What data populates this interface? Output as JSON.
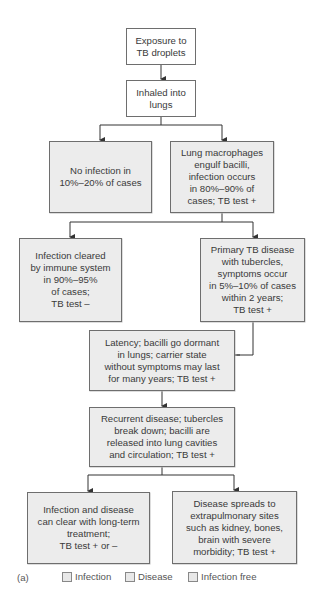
{
  "diagram": {
    "nodes": [
      {
        "id": "exposure",
        "text": "Exposure to\nTB droplets"
      },
      {
        "id": "inhaled",
        "text": "Inhaled into\nlungs"
      },
      {
        "id": "no_infection",
        "text": "No infection in\n10%–20% of cases"
      },
      {
        "id": "macrophages",
        "text": "Lung macrophages\nengulf bacilli,\ninfection occurs\nin 80%–90% of\ncases; TB test +"
      },
      {
        "id": "cleared",
        "text": "Infection cleared\nby immune system\nin 90%–95%\nof cases;\nTB test –"
      },
      {
        "id": "primary",
        "text": "Primary TB disease\nwith tubercles,\nsymptoms occur\nin 5%–10% of cases\nwithin 2 years;\nTB test +"
      },
      {
        "id": "latency",
        "text": "Latency; bacilli go dormant\nin lungs; carrier state\nwithout symptoms may last\nfor many years; TB test +"
      },
      {
        "id": "recurrent",
        "text": "Recurrent disease; tubercles\nbreak down; bacilli are\nreleased into lung cavities\nand circulation; TB test +"
      },
      {
        "id": "treatment",
        "text": "Infection and disease\ncan clear with long-term\ntreatment;\nTB test + or –"
      },
      {
        "id": "extrapulmonary",
        "text": "Disease spreads to\nextrapulmonary sites\nsuch as kidney, bones,\nbrain with severe\nmorbidity; TB test +"
      }
    ],
    "edges": [
      [
        "exposure",
        "inhaled"
      ],
      [
        "inhaled",
        "no_infection"
      ],
      [
        "inhaled",
        "macrophages"
      ],
      [
        "macrophages",
        "cleared"
      ],
      [
        "macrophages",
        "primary"
      ],
      [
        "primary",
        "latency"
      ],
      [
        "latency",
        "recurrent"
      ],
      [
        "recurrent",
        "treatment"
      ],
      [
        "recurrent",
        "extrapulmonary"
      ]
    ]
  },
  "legend": {
    "panel_label": "(a)",
    "items": [
      {
        "label": "Infection"
      },
      {
        "label": "Disease"
      },
      {
        "label": "Infection free"
      }
    ]
  },
  "colors": {
    "box_border": "#6e6e6e",
    "box_fill": "#ececec",
    "line": "#333333"
  }
}
